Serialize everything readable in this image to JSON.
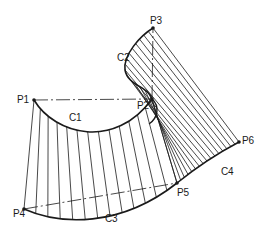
{
  "diagram": {
    "type": "ruled-surface-patches",
    "colors": {
      "stroke": "#1a1a1a",
      "background": "#ffffff"
    },
    "points": [
      {
        "id": "P1",
        "label": "P1",
        "x": 34,
        "y": 100
      },
      {
        "id": "P2",
        "label": "P2",
        "x": 152,
        "y": 99
      },
      {
        "id": "P3",
        "label": "P3",
        "x": 153,
        "y": 28
      },
      {
        "id": "P4",
        "label": "P4",
        "x": 24,
        "y": 209
      },
      {
        "id": "P5",
        "label": "P5",
        "x": 177,
        "y": 183
      },
      {
        "id": "P6",
        "label": "P6",
        "x": 239,
        "y": 142
      }
    ],
    "curves": [
      {
        "id": "C1",
        "label": "C1",
        "from": "P1",
        "to": "P2"
      },
      {
        "id": "C2",
        "label": "C2",
        "from": "P2",
        "to": "P3"
      },
      {
        "id": "C3",
        "label": "C3",
        "from": "P4",
        "to": "P5"
      },
      {
        "id": "C4",
        "label": "C4",
        "from": "P5",
        "to": "P6"
      }
    ],
    "chords": [
      {
        "from": "P1",
        "to": "P2",
        "style": "dash-dot"
      },
      {
        "from": "P2",
        "to": "P3",
        "style": "dash-dot"
      },
      {
        "from": "P4",
        "to": "P5",
        "style": "dash-dot"
      }
    ]
  }
}
